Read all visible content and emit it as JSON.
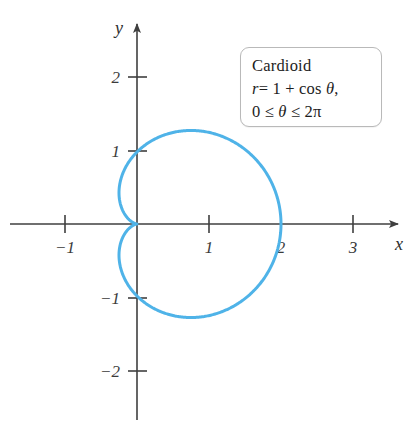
{
  "figure": {
    "background_color": "#ffffff",
    "curve_color": "#4FB3E8",
    "axis_color": "#3f3f3f"
  },
  "annotation": {
    "name": "Cardioid",
    "equation": "r = 1 + cos θ,",
    "domain": "0 ≤ θ ≤ 2π",
    "equation_parts": {
      "r": "r",
      "equals": "= 1 + cos ",
      "theta": "θ",
      "comma": ","
    },
    "domain_parts": {
      "lower": "0 ≤ ",
      "theta": "θ",
      "upper": " ≤ 2π"
    }
  },
  "axes": {
    "x_label": "x",
    "y_label": "y",
    "x_ticks": [
      {
        "value": -1,
        "label": "−1"
      },
      {
        "value": 1,
        "label": "1"
      },
      {
        "value": 2,
        "label": "2"
      },
      {
        "value": 3,
        "label": "3"
      }
    ],
    "y_ticks": [
      {
        "value": 2,
        "label": "2"
      },
      {
        "value": 1,
        "label": "1"
      },
      {
        "value": -1,
        "label": "−1"
      },
      {
        "value": -2,
        "label": "−2"
      }
    ]
  },
  "chart_data": {
    "type": "line",
    "title": "Cardioid",
    "subtitle": "r = 1 + cos θ, 0 ≤ θ ≤ 2π",
    "xlabel": "x",
    "ylabel": "y",
    "grid": false,
    "legend": "none",
    "annotation_position": "upper-right",
    "coordinate_system": "polar-plotted-on-cartesian",
    "polar_equation": "r = 1 + cos(theta)",
    "theta_range": [
      0,
      6.283185307179586
    ],
    "xlim": [
      -1.9,
      3.95
    ],
    "ylim": [
      -2.8,
      2.85
    ],
    "xticks": [
      -1,
      1,
      2,
      3
    ],
    "yticks": [
      -2,
      -1,
      1,
      2
    ],
    "key_points": [
      {
        "theta": 0,
        "r": 2,
        "x": 2,
        "y": 0,
        "note": "rightmost point"
      },
      {
        "theta": 1.5707963,
        "r": 1,
        "x": 0,
        "y": 1,
        "note": "top y-intercept"
      },
      {
        "theta": 2.0943951,
        "r": 1.5,
        "x": -0.75,
        "y": 1.299,
        "note": "max y"
      },
      {
        "theta": 3.1415927,
        "r": 0,
        "x": 0,
        "y": 0,
        "note": "cusp at origin"
      },
      {
        "theta": 4.1887902,
        "r": 1.5,
        "x": -0.75,
        "y": -1.299,
        "note": "min y"
      },
      {
        "theta": 4.712389,
        "r": 1,
        "x": 0,
        "y": -1,
        "note": "bottom y-intercept"
      },
      {
        "theta": 6.2831853,
        "r": 2,
        "x": 2,
        "y": 0,
        "note": "closes at rightmost point"
      }
    ],
    "extents": {
      "x_min": -0.25,
      "x_max": 2,
      "y_min": -1.299,
      "y_max": 1.299
    },
    "series": [
      {
        "name": "r = 1 + cos θ",
        "color": "#4FB3E8",
        "closed": true,
        "samples_theta_deg": [
          0,
          15,
          30,
          45,
          60,
          75,
          90,
          105,
          120,
          135,
          150,
          165,
          180,
          195,
          210,
          225,
          240,
          255,
          270,
          285,
          300,
          315,
          330,
          345,
          360
        ],
        "samples_r": [
          2.0,
          1.966,
          1.866,
          1.707,
          1.5,
          1.259,
          1.0,
          0.741,
          0.5,
          0.293,
          0.134,
          0.034,
          0.0,
          0.034,
          0.134,
          0.293,
          0.5,
          0.741,
          1.0,
          1.259,
          1.5,
          1.707,
          1.866,
          1.966,
          2.0
        ],
        "samples_x": [
          2.0,
          1.899,
          1.616,
          1.207,
          0.75,
          0.326,
          0.0,
          -0.192,
          -0.25,
          -0.207,
          -0.116,
          -0.033,
          0.0,
          -0.033,
          -0.116,
          -0.207,
          -0.25,
          -0.192,
          0.0,
          0.326,
          0.75,
          1.207,
          1.616,
          1.899,
          2.0
        ],
        "samples_y": [
          0.0,
          0.509,
          0.933,
          1.207,
          1.299,
          1.216,
          1.0,
          0.716,
          0.433,
          0.207,
          0.067,
          0.009,
          0.0,
          -0.009,
          -0.067,
          -0.207,
          -0.433,
          -0.716,
          -1.0,
          -1.216,
          -1.299,
          -1.207,
          -0.933,
          -0.509,
          0.0
        ]
      }
    ]
  }
}
